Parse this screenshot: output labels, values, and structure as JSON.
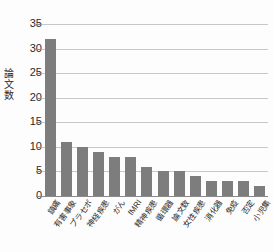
{
  "chart_data": {
    "type": "bar",
    "title": "",
    "xlabel": "",
    "ylabel": "論文数",
    "ylim": [
      0,
      35
    ],
    "ytick_step": 5,
    "yticks": [
      0,
      5,
      10,
      15,
      20,
      25,
      30,
      35
    ],
    "grid": true,
    "legend": "none",
    "bar_color": "#7d7d7d",
    "gridline_color": "#c8c8c8",
    "axis_color": "#8a8a8a",
    "categories": [
      "鎮痛",
      "有害事象",
      "プラセボ",
      "神経疾患",
      "がん",
      "fMRI",
      "精神疾患",
      "循環器",
      "論文数",
      "女性疾患",
      "消化器",
      "免疫",
      "否定",
      "小児集"
    ],
    "values": [
      32,
      11,
      10,
      9,
      8,
      8,
      6,
      5,
      5,
      4,
      3,
      3,
      3,
      2
    ]
  }
}
